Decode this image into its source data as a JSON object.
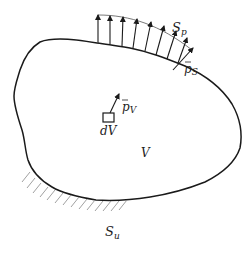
{
  "diagram": {
    "labels": {
      "surface_traction_boundary": "S",
      "surface_traction_boundary_sub": "p",
      "surface_traction": "p",
      "surface_traction_sub": "S",
      "body_force": "p",
      "body_force_sub": "V",
      "volume_element": "dV",
      "volume": "V",
      "displacement_boundary": "S",
      "displacement_boundary_sub": "u"
    },
    "colors": {
      "stroke": "#1a1a1a",
      "hatch": "#888888",
      "background": "#ffffff"
    },
    "traction_arrow_count": 9
  }
}
